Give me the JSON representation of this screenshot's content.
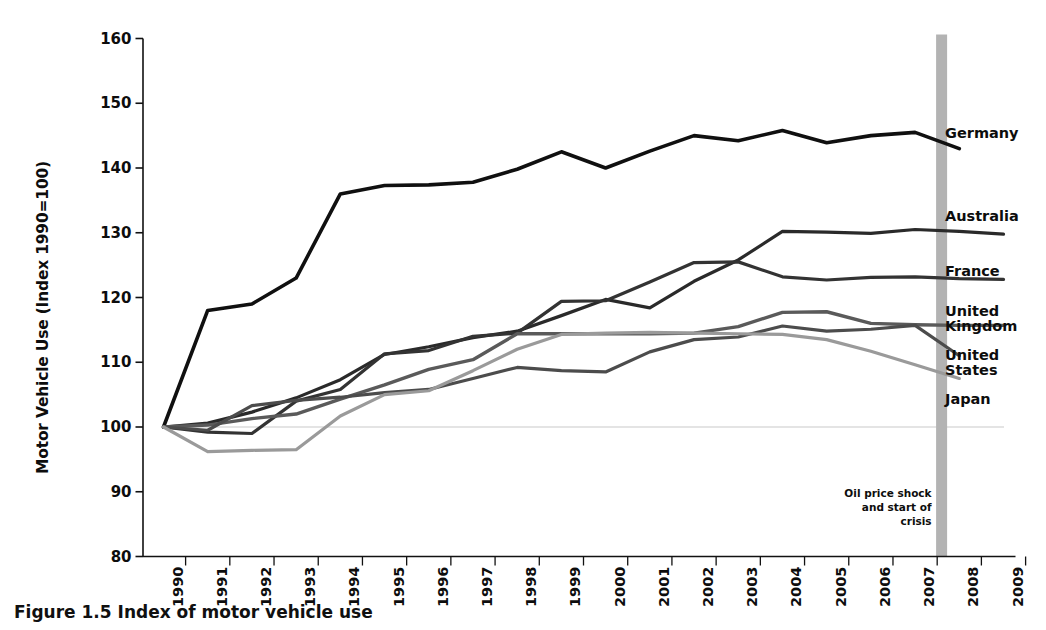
{
  "chart_data": {
    "type": "line",
    "title": "",
    "xlabel": "",
    "ylabel": "Motor Vehicle Use (Index 1990=100)",
    "ylim": [
      80,
      160
    ],
    "yticks": [
      80,
      90,
      100,
      110,
      120,
      130,
      140,
      150,
      160
    ],
    "xlim": [
      1990,
      2009
    ],
    "grid": false,
    "legend_position": "right-inline",
    "categories": [
      1990,
      1991,
      1992,
      1993,
      1994,
      1995,
      1996,
      1997,
      1998,
      1999,
      2000,
      2001,
      2002,
      2003,
      2004,
      2005,
      2006,
      2007,
      2008,
      2009
    ],
    "tick_labels": [
      "1990",
      "1991",
      "1992",
      "1993",
      "1994",
      "1995",
      "1996",
      "1997",
      "1998",
      "1999",
      "2000",
      "2001",
      "2002",
      "2003",
      "2004",
      "2005",
      "2006",
      "2007",
      "2008",
      "2009"
    ],
    "series": [
      {
        "name": "Germany",
        "color": "#101010",
        "width": 3.6,
        "values": [
          100,
          118,
          119,
          123,
          136,
          137.3,
          137.4,
          137.8,
          139.8,
          142.5,
          140,
          142.6,
          145,
          144.2,
          145.8,
          143.9,
          145,
          145.5,
          143,
          null
        ]
      },
      {
        "name": "Australia",
        "color": "#2a2a2a",
        "width": 3.2,
        "values": [
          100,
          100.6,
          102.3,
          104.5,
          107.3,
          111.2,
          112.4,
          113.8,
          114.8,
          117.2,
          119.7,
          118.4,
          122.5,
          125.8,
          130.2,
          130.1,
          129.9,
          130.5,
          130.2,
          129.8
        ]
      },
      {
        "name": "France",
        "color": "#333333",
        "width": 3.2,
        "values": [
          100,
          99.2,
          99,
          104,
          105.8,
          111.3,
          111.8,
          114,
          114.5,
          119.4,
          119.5,
          122.4,
          125.4,
          125.5,
          123.2,
          122.7,
          123.1,
          123.2,
          122.9,
          122.8
        ]
      },
      {
        "name": "United Kingdom",
        "color": "#5a5a5a",
        "width": 3.4,
        "values": [
          100,
          100.3,
          101.3,
          102,
          104.3,
          106.5,
          108.9,
          110.4,
          114.4,
          114.4,
          114.4,
          114.4,
          114.5,
          115.5,
          117.7,
          117.8,
          116,
          115.8,
          115.7,
          115.7
        ]
      },
      {
        "name": "United States",
        "color": "#4c4c4c",
        "width": 3.2,
        "values": [
          100,
          99.5,
          103.3,
          104.1,
          104.6,
          105.3,
          105.8,
          107.5,
          109.2,
          108.7,
          108.5,
          111.6,
          113.5,
          113.9,
          115.6,
          114.8,
          115.1,
          115.7,
          111,
          null
        ]
      },
      {
        "name": "Japan",
        "color": "#9a9a9a",
        "width": 3.2,
        "values": [
          100,
          96.2,
          96.4,
          96.5,
          101.7,
          105,
          105.6,
          108.7,
          112,
          114.3,
          114.5,
          114.6,
          114.5,
          114.4,
          114.3,
          113.5,
          111.7,
          109.6,
          107.5,
          null
        ]
      }
    ],
    "series_labels": [
      {
        "name": "Germany",
        "lines": [
          "Germany"
        ],
        "x": 945,
        "y": 126
      },
      {
        "name": "Australia",
        "lines": [
          "Australia"
        ],
        "x": 945,
        "y": 209
      },
      {
        "name": "France",
        "lines": [
          "France"
        ],
        "x": 945,
        "y": 264
      },
      {
        "name": "United Kingdom",
        "lines": [
          "United",
          "Kingdom"
        ],
        "x": 945,
        "y": 304
      },
      {
        "name": "United States",
        "lines": [
          "United",
          "States"
        ],
        "x": 945,
        "y": 348
      },
      {
        "name": "Japan",
        "lines": [
          "Japan"
        ],
        "x": 945,
        "y": 392
      }
    ],
    "annotations": [
      {
        "name": "oil-price-shock",
        "lines": [
          "Oil price shock",
          "and start of",
          "crisis"
        ],
        "marker_type": "vertical-band",
        "marker_x_value": 2007.6,
        "marker_color": "#b3b3b3"
      }
    ],
    "baseline": {
      "value": 100,
      "color": "#c9c9c9"
    }
  },
  "caption": {
    "text": "Figure 1.5 Index of motor vehicle use"
  }
}
